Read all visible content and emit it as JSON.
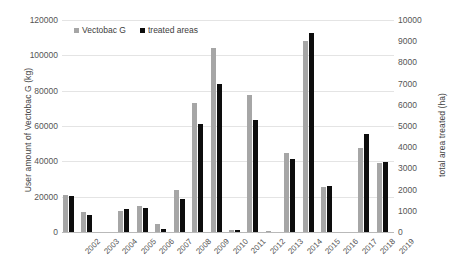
{
  "chart_data": {
    "type": "bar",
    "title": "",
    "xlabel": "",
    "ylabel": "User amount of Vectobac G (kg)",
    "y2label": "total area treated (ha)",
    "grid": true,
    "legend_position": "top-left",
    "ylim": [
      0,
      120000
    ],
    "y2lim": [
      0,
      10000
    ],
    "yticks": [
      "0",
      "20000",
      "40000",
      "60000",
      "80000",
      "100000",
      "120000"
    ],
    "y2ticks": [
      "0",
      "1000",
      "2000",
      "3000",
      "4000",
      "5000",
      "6000",
      "7000",
      "8000",
      "9000",
      "10000"
    ],
    "ytick_values": [
      0,
      20000,
      40000,
      60000,
      80000,
      100000,
      120000
    ],
    "y2tick_values": [
      0,
      1000,
      2000,
      3000,
      4000,
      5000,
      6000,
      7000,
      8000,
      9000,
      10000
    ],
    "categories": [
      "2002",
      "2003",
      "2004",
      "2005",
      "2006",
      "2007",
      "2008",
      "2009",
      "2010",
      "2011",
      "2012",
      "2013",
      "2014",
      "2015",
      "2016",
      "2017",
      "2018",
      "2019"
    ],
    "series": [
      {
        "name": "Vectobac G",
        "axis": "left",
        "color": "#a6a6a6",
        "unit": "kg",
        "values": [
          21000,
          11500,
          0,
          12000,
          14500,
          4500,
          24000,
          73000,
          104000,
          1000,
          77500,
          400,
          45000,
          108000,
          25500,
          0,
          47500,
          39000
        ]
      },
      {
        "name": "treated areas",
        "axis": "right",
        "color": "#0d0d0d",
        "unit": "ha",
        "values": [
          1700,
          800,
          0,
          1100,
          1150,
          150,
          1550,
          5100,
          7000,
          100,
          5300,
          0,
          3450,
          9400,
          2150,
          0,
          4600,
          3300
        ]
      }
    ]
  },
  "legend": {
    "items": [
      {
        "label": "Vectobac G",
        "color": "#a6a6a6"
      },
      {
        "label": "treated areas",
        "color": "#0d0d0d"
      }
    ]
  }
}
